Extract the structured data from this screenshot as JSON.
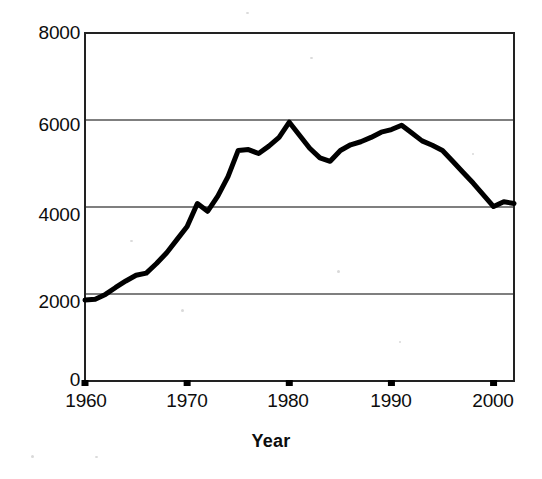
{
  "chart_data": {
    "type": "line",
    "title": "",
    "xlabel": "Year",
    "ylabel": "",
    "xlim": [
      1960,
      2002
    ],
    "ylim": [
      0,
      8000
    ],
    "xticks": [
      1960,
      1970,
      1980,
      1990,
      2000
    ],
    "yticks": [
      0,
      2000,
      4000,
      6000,
      8000
    ],
    "xtick_labels": [
      "1960",
      "1970",
      "1980",
      "1990",
      "2000"
    ],
    "ytick_labels": [
      "0",
      "2000",
      "4000",
      "6000",
      "8000"
    ],
    "grid": "horizontal",
    "legend": "none",
    "line_color": "#000000",
    "line_width": 5,
    "x": [
      1960,
      1961,
      1962,
      1963,
      1964,
      1965,
      1966,
      1967,
      1968,
      1969,
      1970,
      1971,
      1972,
      1973,
      1974,
      1975,
      1976,
      1977,
      1978,
      1979,
      1980,
      1981,
      1982,
      1983,
      1984,
      1985,
      1986,
      1987,
      1988,
      1989,
      1990,
      1991,
      1992,
      1993,
      1994,
      1995,
      1996,
      1997,
      1998,
      1999,
      2000,
      2001,
      2002
    ],
    "values": [
      1860,
      1880,
      1990,
      2150,
      2300,
      2430,
      2480,
      2700,
      2950,
      3250,
      3550,
      4080,
      3900,
      4250,
      4700,
      5300,
      5320,
      5230,
      5400,
      5600,
      5950,
      5650,
      5350,
      5130,
      5050,
      5300,
      5430,
      5500,
      5600,
      5720,
      5780,
      5880,
      5700,
      5520,
      5420,
      5300,
      5050,
      4800,
      4550,
      4280,
      4010,
      4120,
      4080
    ]
  },
  "yaxis": {
    "labels": [
      {
        "text": "8000",
        "value": 8000
      },
      {
        "text": "6000",
        "value": 6000
      },
      {
        "text": "4000",
        "value": 4000
      },
      {
        "text": "2000",
        "value": 2000
      },
      {
        "text": "0",
        "value": 0
      }
    ]
  },
  "xaxis": {
    "labels": [
      {
        "text": "1960",
        "value": 1960
      },
      {
        "text": "1970",
        "value": 1970
      },
      {
        "text": "1980",
        "value": 1980
      },
      {
        "text": "1990",
        "value": 1990
      },
      {
        "text": "2000",
        "value": 2000
      }
    ],
    "title": "Year"
  }
}
